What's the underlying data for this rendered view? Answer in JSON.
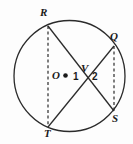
{
  "figure": {
    "type": "circle-geometry-diagram",
    "background_color": "#fdfdfd",
    "stroke_color": "#2b2b2b",
    "width": 133,
    "height": 144,
    "circle": {
      "center_x": 69.5,
      "center_y": 76,
      "radius": 55.5,
      "center_dot_label": "O",
      "center_dot_x": 65.5,
      "center_dot_y": 75.5
    },
    "points": [
      {
        "label": "R",
        "x": 48,
        "y": 26,
        "label_x": 40,
        "label_y": 7
      },
      {
        "label": "Q",
        "x": 114,
        "y": 46,
        "label_x": 110,
        "label_y": 31
      },
      {
        "label": "S",
        "x": 114,
        "y": 111,
        "label_x": 112,
        "label_y": 113
      },
      {
        "label": "T",
        "x": 48,
        "y": 127,
        "label_x": 44,
        "label_y": 128
      },
      {
        "label": "V",
        "x": 86,
        "y": 75,
        "label_x": 81,
        "label_y": 63
      }
    ],
    "chords_solid": [
      {
        "name": "chord-RS",
        "from": "R",
        "to": "S"
      },
      {
        "name": "chord-TQ",
        "from": "T",
        "to": "Q"
      }
    ],
    "chords_dashed": [
      {
        "name": "chord-RT",
        "from": "R",
        "to": "T"
      },
      {
        "name": "chord-QS",
        "from": "Q",
        "to": "S"
      }
    ],
    "angle_labels": [
      {
        "label": "1",
        "x": 73,
        "y": 72
      },
      {
        "label": "2",
        "x": 92,
        "y": 72
      }
    ]
  }
}
